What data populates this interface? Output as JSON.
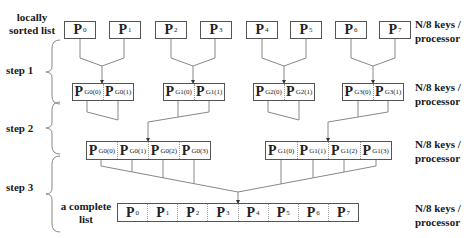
{
  "left_labels": {
    "locally_sorted": "locally sorted list",
    "step1": "step 1",
    "step2": "step 2",
    "step3": "step 3",
    "complete": "a complete list"
  },
  "right_label": "N/8 keys / processor",
  "row0": [
    {
      "p": "P",
      "sub": "0"
    },
    {
      "p": "P",
      "sub": "1"
    },
    {
      "p": "P",
      "sub": "2"
    },
    {
      "p": "P",
      "sub": "3"
    },
    {
      "p": "P",
      "sub": "4"
    },
    {
      "p": "P",
      "sub": "5"
    },
    {
      "p": "P",
      "sub": "6"
    },
    {
      "p": "P",
      "sub": "7"
    }
  ],
  "row1": [
    [
      {
        "p": "P",
        "sub": "G0(0)"
      },
      {
        "p": "P",
        "sub": "G0(1)"
      }
    ],
    [
      {
        "p": "P",
        "sub": "G1(0)"
      },
      {
        "p": "P",
        "sub": "G1(1)"
      }
    ],
    [
      {
        "p": "P",
        "sub": "G2(0)"
      },
      {
        "p": "P",
        "sub": "G2(1)"
      }
    ],
    [
      {
        "p": "P",
        "sub": "G3(0)"
      },
      {
        "p": "P",
        "sub": "G3(1)"
      }
    ]
  ],
  "row2": [
    [
      {
        "p": "P",
        "sub": "G0(0)"
      },
      {
        "p": "P",
        "sub": "G0(1)"
      },
      {
        "p": "P",
        "sub": "G0(2)"
      },
      {
        "p": "P",
        "sub": "G0(3)"
      }
    ],
    [
      {
        "p": "P",
        "sub": "G1(0)"
      },
      {
        "p": "P",
        "sub": "G1(1)"
      },
      {
        "p": "P",
        "sub": "G1(2)"
      },
      {
        "p": "P",
        "sub": "G1(3)"
      }
    ]
  ],
  "row3": [
    {
      "p": "P",
      "sub": "0"
    },
    {
      "p": "P",
      "sub": "1"
    },
    {
      "p": "P",
      "sub": "2"
    },
    {
      "p": "P",
      "sub": "3"
    },
    {
      "p": "P",
      "sub": "4"
    },
    {
      "p": "P",
      "sub": "5"
    },
    {
      "p": "P",
      "sub": "6"
    },
    {
      "p": "P",
      "sub": "7"
    }
  ]
}
